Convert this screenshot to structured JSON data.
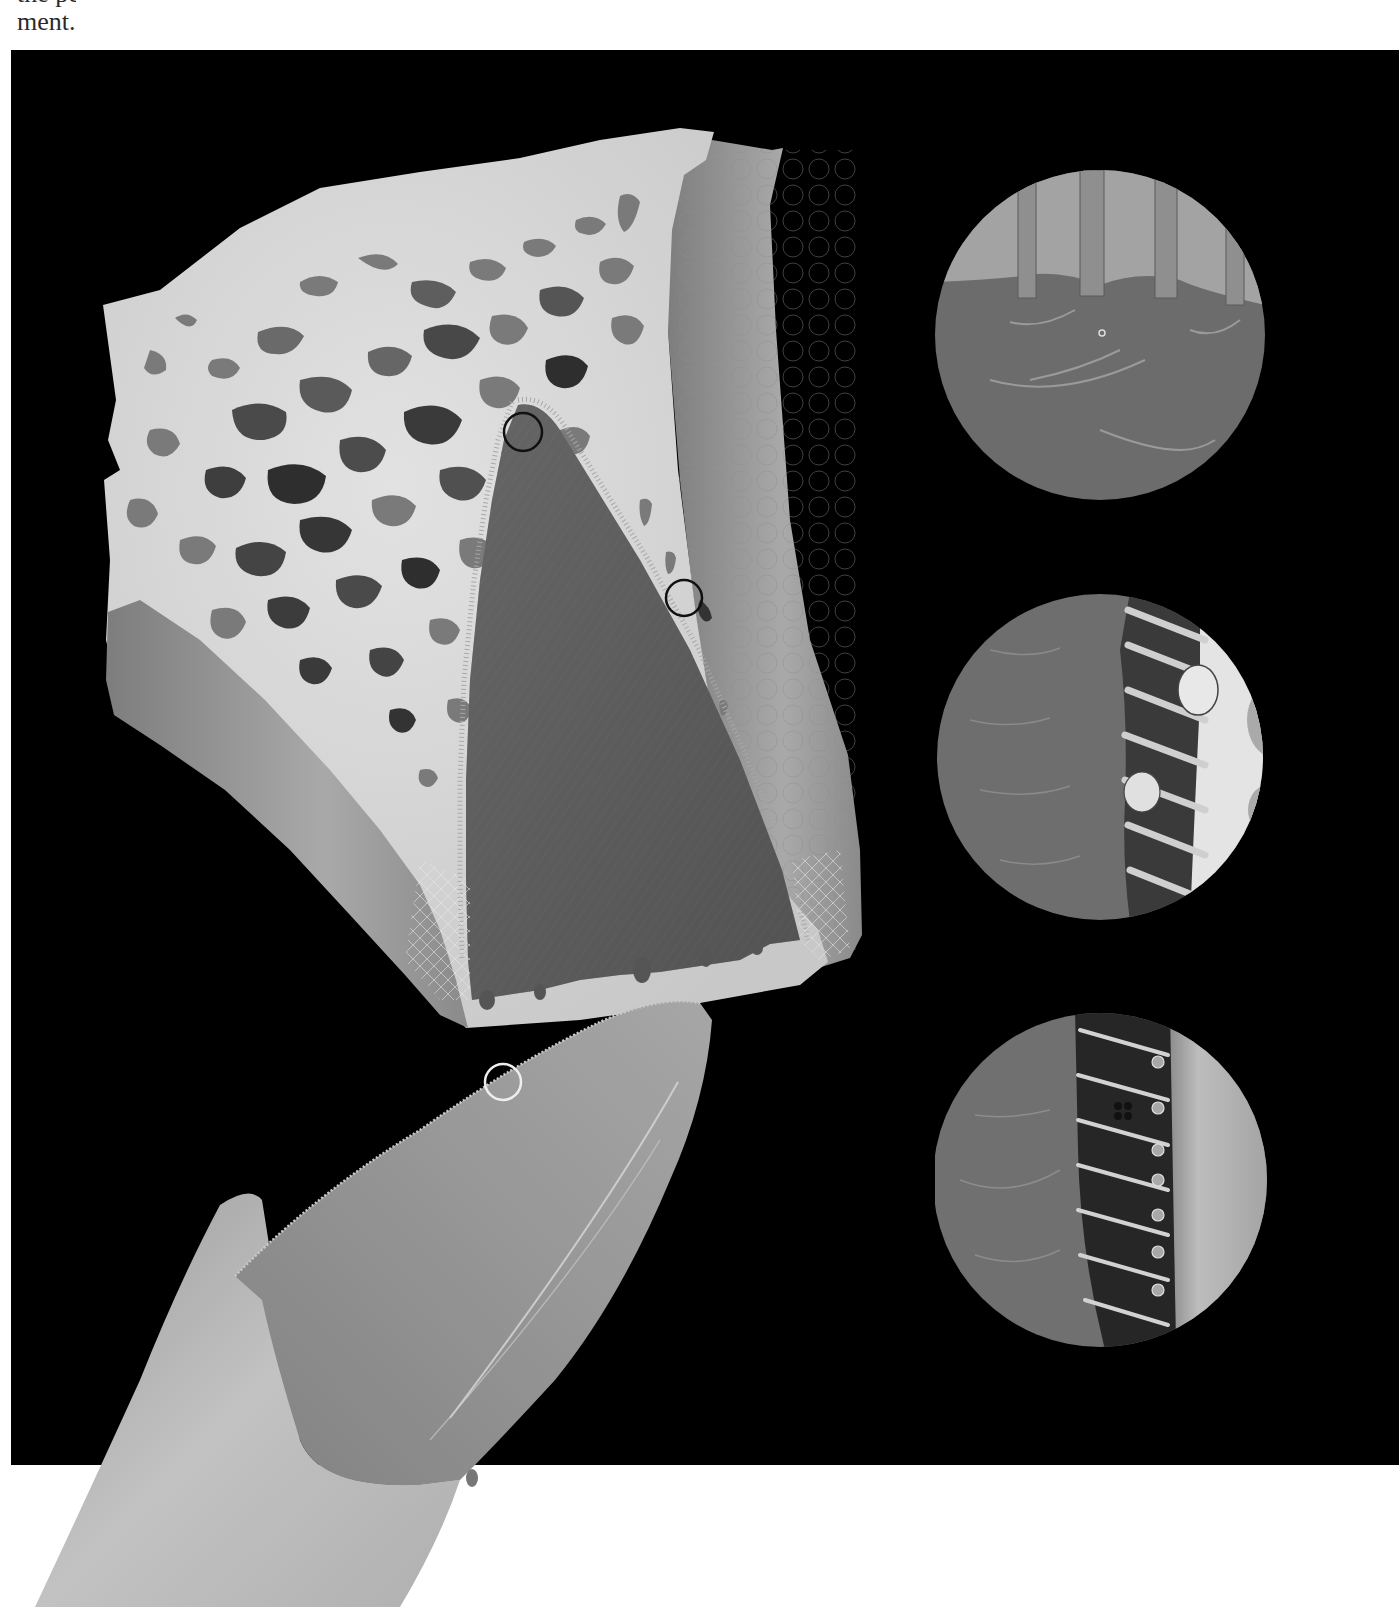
{
  "caption": {
    "cut_line": "the periosteum and the periodontal liga-",
    "last_line": "ment."
  },
  "figure": {
    "panel_color": "#000000",
    "colors": {
      "bone": "#d6d6d6",
      "cortical_plate": "#9e9e9e",
      "ligament_space": "#5e5e5e",
      "tooth_crown": "#8f8f8f",
      "tooth_root": "#b5b5b5",
      "marker_dark": "#111111",
      "marker_light": "#eeeeee"
    },
    "markers": [
      {
        "name": "marker-apex",
        "style": "dark",
        "links_to": "inset-top"
      },
      {
        "name": "marker-side",
        "style": "dark",
        "links_to": "inset-middle"
      },
      {
        "name": "marker-tooth",
        "style": "light",
        "links_to": "inset-bottom"
      }
    ],
    "insets": [
      {
        "name": "inset-top",
        "depicts": "ligament fibers inserting into tissue surface"
      },
      {
        "name": "inset-middle",
        "depicts": "fibers anchoring into bone with osteocytes"
      },
      {
        "name": "inset-bottom",
        "depicts": "fibers anchoring into cementum with cementocytes"
      }
    ]
  }
}
